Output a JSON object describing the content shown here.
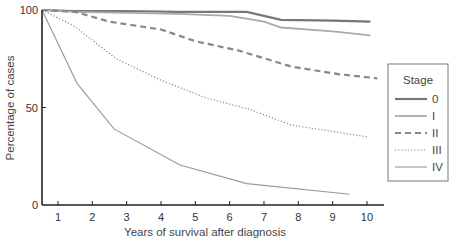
{
  "chart_data": {
    "type": "line",
    "title": "",
    "xlabel": "Years of survival after diagnosis",
    "ylabel": "Percentage of cases",
    "xlim": [
      0.5,
      10.5
    ],
    "ylim": [
      0,
      100
    ],
    "x_ticks": [
      1,
      2,
      3,
      4,
      5,
      6,
      7,
      8,
      9,
      10
    ],
    "y_ticks": [
      0,
      50,
      100
    ],
    "grid": false,
    "legend_position": "right",
    "legend_title": "Stage",
    "series": [
      {
        "name": "0",
        "style": "solid-thick",
        "color": "#777777",
        "x": [
          0.5,
          1.5,
          3,
          4.5,
          5.5,
          6.5,
          7.5,
          9,
          10.1
        ],
        "y": [
          100,
          99.5,
          99.5,
          99,
          99,
          99,
          95,
          94.5,
          94
        ]
      },
      {
        "name": "I",
        "style": "solid",
        "color": "#aaaaaa",
        "x": [
          0.5,
          1.5,
          3,
          4.5,
          6,
          7,
          7.5,
          9,
          10.1
        ],
        "y": [
          100,
          99,
          98.5,
          98,
          97,
          94,
          91,
          89,
          87
        ]
      },
      {
        "name": "II",
        "style": "dashed",
        "color": "#888888",
        "x": [
          0.5,
          1.5,
          2.5,
          4,
          5,
          6.3,
          7.8,
          9.2,
          10.3
        ],
        "y": [
          100,
          99,
          94,
          90,
          84,
          79,
          71,
          67,
          65
        ]
      },
      {
        "name": "III",
        "style": "dotted",
        "color": "#888888",
        "x": [
          0.5,
          1.45,
          2.7,
          4,
          5.3,
          6.6,
          7.8,
          10
        ],
        "y": [
          100,
          92,
          75,
          64,
          55,
          49,
          41,
          35
        ]
      },
      {
        "name": "IV",
        "style": "solid-thin",
        "color": "#999999",
        "x": [
          0.5,
          1.55,
          2.63,
          4.55,
          6.5,
          9.5
        ],
        "y": [
          100,
          62.5,
          39,
          20.5,
          11,
          5.5
        ]
      }
    ]
  }
}
